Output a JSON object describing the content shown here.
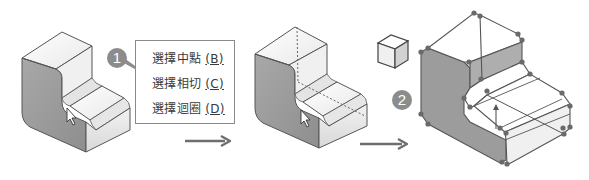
{
  "diagram": {
    "kind": "cad-selection-tutorial",
    "steps": [
      {
        "number": "1",
        "description": "Right-click part face and choose tangency selection from menu"
      },
      {
        "number": "2",
        "description": "Tangent chain of faces selected with handles shown"
      }
    ]
  },
  "badges": {
    "step1": "1",
    "step2": "2"
  },
  "context_menu": {
    "items": [
      {
        "label": "選擇中點",
        "key": "(B)"
      },
      {
        "label": "選擇相切",
        "key": "(C)"
      },
      {
        "label": "選擇迴圈",
        "key": "(D)"
      }
    ],
    "highlighted_index": 1
  },
  "icons": {
    "pointer": "mouse-cursor-icon",
    "view_cube": "view-cube-icon",
    "arrow": "right-arrow-icon",
    "drag_handle": "up-arrow-handle-icon"
  },
  "colors": {
    "badge": "#8c8c8c",
    "face_dark": "#9a9a9a",
    "face_light": "#f4f4f4",
    "edge": "#555555",
    "arrow": "#6e6e6e",
    "vertex_dot": "#6a6a6a"
  }
}
